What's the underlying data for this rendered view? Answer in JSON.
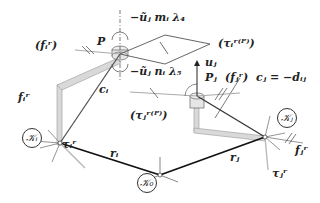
{
  "diagram": {
    "type": "kinematic-loop-closure",
    "frames": {
      "K0": "𝒦₀",
      "Ki": "𝒦ᵢ",
      "Kj": "𝒦ⱼ"
    },
    "labels": {
      "P": "P",
      "Pj": "Pⱼ",
      "fi_paren": "(fᵢʳ)",
      "fi": "fᵢʳ",
      "fj_paren": "(fⱼʳ)",
      "fj": "fⱼʳ",
      "taui": "τᵢʳ",
      "tauj": "τⱼʳ",
      "taui_P": "(τᵢʳ⁽ᴾ⁾)",
      "tauj_P": "(τⱼʳ⁽ᴾ⁾)",
      "ci": "cᵢ",
      "cj_eq": "cⱼ = −dᵢⱼ",
      "uj": "uⱼ",
      "ri": "rᵢ",
      "rj": "rⱼ",
      "constraint_m": "−ũⱼ mᵢ λ₄",
      "constraint_n": "−ũⱼ nᵢ λ₅"
    },
    "colors": {
      "link_fill": "#d9d9d9",
      "link_stroke": "#888888",
      "vector_dark": "#222222",
      "vector_gray": "#aaaaaa"
    }
  }
}
